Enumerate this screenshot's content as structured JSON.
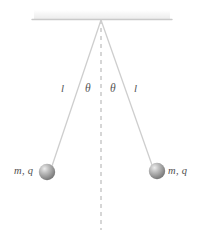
{
  "figure": {
    "background_color": "#ffffff",
    "ceiling": {
      "name": "support-ceiling",
      "line_color": "#c9c9c9",
      "hatch_band_color": "#f2f2f2",
      "x_start": 32,
      "x_end": 172,
      "y": 19
    },
    "pivot": {
      "x": 101,
      "y": 20
    },
    "vertical_dashed_line": {
      "color": "#b5b5b5",
      "dash": "4 4",
      "x": 101,
      "y_start": 20,
      "y_end": 230
    },
    "strings": [
      {
        "name": "string-left",
        "color": "#cfcfcf",
        "x1": 101,
        "y1": 20,
        "x2": 52,
        "y2": 166
      },
      {
        "name": "string-right",
        "color": "#cfcfcf",
        "x1": 101,
        "y1": 20,
        "x2": 152,
        "y2": 165
      }
    ],
    "bobs": [
      {
        "name": "bob-left",
        "cx": 47,
        "cy": 172,
        "r": 8,
        "color_highlight": "#e3e3e3",
        "color_mid": "#9a9a9a",
        "color_edge": "#6e6e6e",
        "label": "m, q",
        "label_side": "left"
      },
      {
        "name": "bob-right",
        "cx": 157,
        "cy": 171,
        "r": 8,
        "color_highlight": "#e3e3e3",
        "color_mid": "#9a9a9a",
        "color_edge": "#6e6e6e",
        "label": "m, q",
        "label_side": "right"
      }
    ],
    "labels": {
      "length_left": "l",
      "angle_left": "θ",
      "angle_right": "θ",
      "length_right": "l",
      "mass_charge_left": "m, q",
      "mass_charge_right": "m, q"
    },
    "colors": {
      "line": "#c9c9c9",
      "dashed": "#b5b5b5",
      "text": "#4f4f4f",
      "sphere": "#9a9a9a"
    }
  }
}
